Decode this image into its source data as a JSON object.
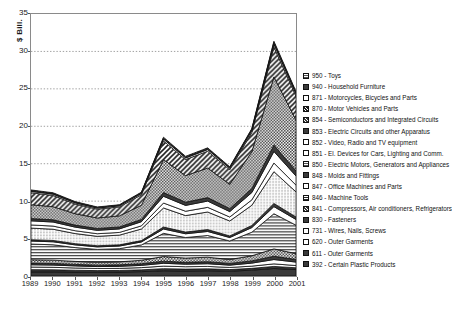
{
  "axes": {
    "ylabel": "$ Bill.",
    "yticks": [
      "0",
      "5",
      "10",
      "15",
      "20",
      "25",
      "30",
      "35"
    ],
    "xticks": [
      "1989",
      "1990",
      "1991",
      "1992",
      "1993",
      "1994",
      "1995",
      "1996",
      "1997",
      "1998",
      "1999",
      "2000",
      "2001"
    ]
  },
  "legend": {
    "items": [
      {
        "code": "950",
        "label": "950 - Toys",
        "pattern": "grid-dots"
      },
      {
        "code": "940",
        "label": "940 - Household Furniture",
        "pattern": "solid-dark"
      },
      {
        "code": "871",
        "label": "871 - Motorcycles, Bicycles and Parts",
        "pattern": "white"
      },
      {
        "code": "870",
        "label": "870 - Motor Vehicles and Parts",
        "pattern": "diag-hatch"
      },
      {
        "code": "854",
        "label": "854 - Semiconductors and Integrated Circuits",
        "pattern": "checker"
      },
      {
        "code": "853",
        "label": "853 - Electric Circuits and other Apparatus",
        "pattern": "solid-dark"
      },
      {
        "code": "852",
        "label": "852 - Video, Radio and TV equipment",
        "pattern": "white"
      },
      {
        "code": "851",
        "label": "851 - El. Devices for Cars, Lighting and Comm.",
        "pattern": "white"
      },
      {
        "code": "850",
        "label": "850 - Electric Motors, Generators and Appliances",
        "pattern": "fine-dots"
      },
      {
        "code": "848",
        "label": "848 - Molds and Fittings",
        "pattern": "solid-dark"
      },
      {
        "code": "847",
        "label": "847 - Office Machines and Parts",
        "pattern": "white"
      },
      {
        "code": "846",
        "label": "846 - Machine Tools",
        "pattern": "horiz-lines"
      },
      {
        "code": "841",
        "label": "841 - Compressors, Air conditioners, Refrigerators",
        "pattern": "checker"
      },
      {
        "code": "830",
        "label": "830 - Fasteners",
        "pattern": "solid-dark"
      },
      {
        "code": "731",
        "label": "731 - Wires, Nails, Screws",
        "pattern": "white"
      },
      {
        "code": "620",
        "label": "620 - Outer Garments",
        "pattern": "white"
      },
      {
        "code": "611",
        "label": "611 - Outer Garments",
        "pattern": "solid-dark"
      },
      {
        "code": "392",
        "label": "392 - Certain Plastic Products",
        "pattern": "solid-dark"
      }
    ]
  },
  "chart_data": {
    "type": "area",
    "title": "",
    "xlabel": "",
    "ylabel": "$ Bill.",
    "ylim": [
      0,
      35
    ],
    "grid": true,
    "legend_position": "right",
    "stacked": true,
    "x": [
      "1989",
      "1990",
      "1991",
      "1992",
      "1993",
      "1994",
      "1995",
      "1996",
      "1997",
      "1998",
      "1999",
      "2000",
      "2001"
    ],
    "total": [
      11.5,
      11.0,
      9.8,
      9.1,
      9.3,
      11.2,
      18.5,
      16.0,
      16.8,
      14.6,
      19.5,
      31.0,
      24.6
    ],
    "series": [
      {
        "name": "392 - Certain Plastic Products",
        "pattern": "solid-dark",
        "values": [
          0.55,
          0.55,
          0.52,
          0.5,
          0.52,
          0.58,
          0.7,
          0.66,
          0.7,
          0.64,
          0.78,
          1.0,
          0.86
        ]
      },
      {
        "name": "611 - Outer Garments",
        "pattern": "solid-dark",
        "values": [
          0.3,
          0.28,
          0.25,
          0.22,
          0.22,
          0.24,
          0.28,
          0.26,
          0.26,
          0.22,
          0.24,
          0.28,
          0.24
        ]
      },
      {
        "name": "620 - Outer Garments",
        "pattern": "white",
        "values": [
          0.35,
          0.33,
          0.3,
          0.28,
          0.28,
          0.3,
          0.34,
          0.32,
          0.32,
          0.28,
          0.3,
          0.34,
          0.3
        ]
      },
      {
        "name": "731 - Wires, Nails, Screws",
        "pattern": "white",
        "values": [
          0.3,
          0.3,
          0.28,
          0.26,
          0.27,
          0.3,
          0.38,
          0.34,
          0.36,
          0.31,
          0.4,
          0.58,
          0.46
        ]
      },
      {
        "name": "830 - Fasteners",
        "pattern": "solid-dark",
        "values": [
          0.22,
          0.22,
          0.2,
          0.19,
          0.2,
          0.22,
          0.28,
          0.25,
          0.27,
          0.23,
          0.3,
          0.44,
          0.35
        ]
      },
      {
        "name": "841 - Compressors, Air conditioners, Refrigerators",
        "pattern": "checker",
        "values": [
          0.45,
          0.44,
          0.4,
          0.38,
          0.4,
          0.46,
          0.62,
          0.56,
          0.6,
          0.52,
          0.68,
          0.98,
          0.78
        ]
      },
      {
        "name": "846 - Machine Tools",
        "pattern": "horiz-lines",
        "values": [
          2.1,
          2.05,
          1.85,
          1.72,
          1.76,
          2.05,
          3.1,
          2.75,
          2.9,
          2.48,
          3.15,
          4.7,
          3.8
        ]
      },
      {
        "name": "847 - Office Machines and Parts",
        "pattern": "white",
        "values": [
          0.4,
          0.4,
          0.36,
          0.34,
          0.35,
          0.4,
          0.58,
          0.5,
          0.54,
          0.46,
          0.62,
          0.95,
          0.76
        ]
      },
      {
        "name": "848 - Molds and Fittings",
        "pattern": "solid-dark",
        "values": [
          0.18,
          0.18,
          0.16,
          0.15,
          0.16,
          0.18,
          0.26,
          0.23,
          0.25,
          0.21,
          0.28,
          0.42,
          0.34
        ]
      },
      {
        "name": "850 - Electric Motors, Generators and Appliances",
        "pattern": "fine-dots",
        "values": [
          1.55,
          1.5,
          1.35,
          1.26,
          1.3,
          1.55,
          2.55,
          2.2,
          2.35,
          2.0,
          2.7,
          4.25,
          3.35
        ]
      },
      {
        "name": "851 - El. Devices for Cars, Lighting and Comm.",
        "pattern": "white",
        "values": [
          0.42,
          0.42,
          0.38,
          0.35,
          0.36,
          0.42,
          0.66,
          0.58,
          0.62,
          0.53,
          0.72,
          1.15,
          0.9
        ]
      },
      {
        "name": "852 - Video, Radio and TV equipment",
        "pattern": "white",
        "values": [
          0.55,
          0.54,
          0.48,
          0.45,
          0.47,
          0.55,
          0.9,
          0.78,
          0.84,
          0.72,
          0.98,
          1.55,
          1.22
        ]
      },
      {
        "name": "853 - Electric Circuits and other Apparatus",
        "pattern": "solid-dark",
        "values": [
          0.3,
          0.3,
          0.27,
          0.25,
          0.26,
          0.3,
          0.5,
          0.43,
          0.46,
          0.4,
          0.54,
          0.85,
          0.67
        ]
      },
      {
        "name": "854 - Semiconductors and Integrated Circuits",
        "pattern": "checker",
        "values": [
          1.85,
          1.75,
          1.52,
          1.4,
          1.48,
          1.9,
          4.4,
          3.55,
          3.95,
          3.25,
          4.9,
          9.1,
          6.8
        ]
      },
      {
        "name": "870 - Motor Vehicles and Parts",
        "pattern": "diag-hatch",
        "values": [
          1.6,
          1.5,
          1.3,
          1.18,
          1.2,
          1.4,
          2.5,
          2.15,
          2.25,
          1.95,
          2.6,
          4.0,
          3.2
        ]
      },
      {
        "name": "871 - Motorcycles, Bicycles and Parts",
        "pattern": "white",
        "values": [
          0.18,
          0.17,
          0.15,
          0.14,
          0.14,
          0.17,
          0.24,
          0.21,
          0.22,
          0.19,
          0.25,
          0.38,
          0.3
        ]
      },
      {
        "name": "940 - Household Furniture",
        "pattern": "solid-dark",
        "values": [
          0.12,
          0.11,
          0.1,
          0.09,
          0.09,
          0.11,
          0.15,
          0.13,
          0.14,
          0.12,
          0.16,
          0.24,
          0.19
        ]
      },
      {
        "name": "950 - Toys",
        "pattern": "grid-dots",
        "values": [
          0.08,
          0.08,
          0.07,
          0.06,
          0.06,
          0.07,
          0.1,
          0.09,
          0.09,
          0.08,
          0.1,
          0.16,
          0.13
        ]
      }
    ]
  }
}
